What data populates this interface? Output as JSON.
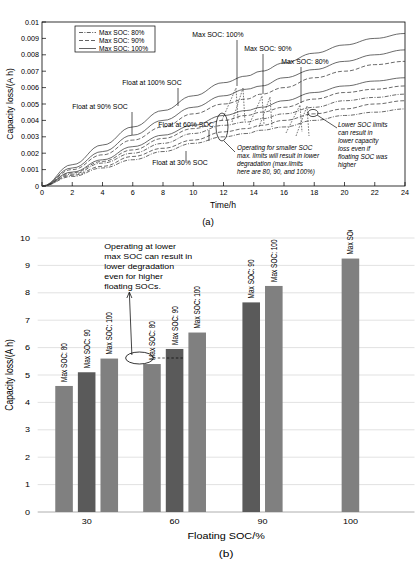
{
  "figure": {
    "panel_a_caption": "(a)",
    "panel_b_caption": "(b)"
  },
  "chart_data": [
    {
      "id": "panel_a",
      "type": "line",
      "title": "",
      "xlabel": "Time/h",
      "ylabel": "Capacity loss/(A h)",
      "xlim": [
        0,
        24
      ],
      "ylim": [
        0,
        0.01
      ],
      "xticks": [
        0,
        2,
        4,
        6,
        8,
        10,
        12,
        14,
        16,
        18,
        20,
        22,
        24
      ],
      "xticklabels": [
        "0",
        "2",
        "4",
        "6",
        "8",
        "10",
        "12",
        "14",
        "16",
        "18",
        "20",
        "22",
        "24"
      ],
      "yticks": [
        0,
        0.001,
        0.002,
        0.003,
        0.004,
        0.005,
        0.006,
        0.007,
        0.008,
        0.009,
        0.01
      ],
      "yticklabels": [
        "0",
        "0.001",
        "0.002",
        "0.003",
        "0.004",
        "0.005",
        "0.006",
        "0.007",
        "0.008",
        "0.009",
        "0.01"
      ],
      "grid": false,
      "legend_position": "upper-left",
      "legend": [
        {
          "label": "Max SOC: 80%",
          "style": "dash-dot"
        },
        {
          "label": "Max SOC: 90%",
          "style": "dashed"
        },
        {
          "label": "Max SOC: 100%",
          "style": "solid"
        }
      ],
      "series": [
        {
          "name": "Float 100% SOC / Max SOC: 100%",
          "style": "solid",
          "x": [
            0,
            2,
            4,
            6,
            8,
            10,
            12,
            13.5,
            14.5,
            16,
            18,
            20,
            22,
            24
          ],
          "y": [
            0,
            0.0013,
            0.0025,
            0.0036,
            0.0046,
            0.0055,
            0.0063,
            0.0067,
            0.007,
            0.0075,
            0.0081,
            0.0086,
            0.009,
            0.0093
          ]
        },
        {
          "name": "Float 90% SOC / Max SOC: 100%",
          "style": "solid",
          "x": [
            0,
            2,
            4,
            6,
            8,
            10,
            12,
            13.5,
            14.5,
            16,
            18,
            20,
            22,
            24
          ],
          "y": [
            0,
            0.0011,
            0.0021,
            0.0031,
            0.004,
            0.0048,
            0.0055,
            0.0059,
            0.0061,
            0.0066,
            0.0071,
            0.0076,
            0.008,
            0.0083
          ]
        },
        {
          "name": "Float 90% SOC / Max SOC: 90%",
          "style": "dashed",
          "x": [
            0,
            2,
            4,
            6,
            8,
            10,
            12,
            13.5,
            14.5,
            16,
            18,
            20,
            22,
            24
          ],
          "y": [
            0,
            0.001,
            0.0019,
            0.0028,
            0.0036,
            0.0044,
            0.005,
            0.0053,
            0.0056,
            0.006,
            0.0066,
            0.007,
            0.0074,
            0.0076
          ]
        },
        {
          "name": "Float 60% SOC / Max SOC: 100%",
          "style": "solid",
          "x": [
            0,
            2,
            4,
            6,
            8,
            10,
            12,
            13.5,
            14.5,
            16,
            18,
            20,
            22,
            24
          ],
          "y": [
            0,
            0.00085,
            0.0016,
            0.0024,
            0.0031,
            0.0037,
            0.0043,
            0.0046,
            0.0048,
            0.0052,
            0.0057,
            0.0061,
            0.0064,
            0.0066
          ]
        },
        {
          "name": "Float 60% SOC / Max SOC: 90%",
          "style": "dashed",
          "x": [
            0,
            2,
            4,
            6,
            8,
            10,
            12,
            13.5,
            14.5,
            16,
            18,
            20,
            22,
            24
          ],
          "y": [
            0,
            0.0008,
            0.0015,
            0.0022,
            0.0029,
            0.0035,
            0.004,
            0.0043,
            0.0045,
            0.0048,
            0.0053,
            0.0057,
            0.0059,
            0.0061
          ]
        },
        {
          "name": "Float 60% SOC / Max SOC: 80%",
          "style": "dash-dot",
          "x": [
            0,
            2,
            4,
            6,
            8,
            10,
            12,
            13.5,
            14.5,
            16,
            18,
            20,
            22,
            24
          ],
          "y": [
            0,
            0.00072,
            0.0014,
            0.002,
            0.0026,
            0.0032,
            0.0037,
            0.0039,
            0.0041,
            0.0044,
            0.0048,
            0.0052,
            0.0054,
            0.0056
          ]
        },
        {
          "name": "Float 30% SOC / Max SOC: 90%",
          "style": "dashed",
          "x": [
            0,
            2,
            4,
            6,
            8,
            10,
            12,
            13.5,
            14.5,
            16,
            18,
            20,
            22,
            24
          ],
          "y": [
            0,
            0.00065,
            0.0012,
            0.0018,
            0.0023,
            0.0028,
            0.0033,
            0.0035,
            0.0037,
            0.004,
            0.0044,
            0.0047,
            0.005,
            0.0052
          ]
        },
        {
          "name": "Float 30% SOC / Max SOC: 80%",
          "style": "dash-dot",
          "x": [
            0,
            2,
            4,
            6,
            8,
            10,
            12,
            13.5,
            14.5,
            16,
            18,
            20,
            22,
            24
          ],
          "y": [
            0,
            0.00058,
            0.0011,
            0.0016,
            0.0021,
            0.0026,
            0.003,
            0.0032,
            0.0034,
            0.0036,
            0.004,
            0.0043,
            0.0045,
            0.0047
          ]
        }
      ],
      "annotations": [
        {
          "text": "Max SOC: 100%",
          "target_x": 13.6,
          "target_y": 0.0069
        },
        {
          "text": "Max SOC: 90%",
          "target_x": 14.6,
          "target_y": 0.0065
        },
        {
          "text": "Max SOC: 80%",
          "target_x": 17.1,
          "target_y": 0.0061
        },
        {
          "text": "Float at 100% SOC",
          "target_x": 9.0,
          "target_y": 0.0044
        },
        {
          "text": "Float at 90% SOC",
          "target_x": 6.0,
          "target_y": 0.0031
        },
        {
          "text": "Float at 60% SOC",
          "target_x": 11.7,
          "target_y": 0.0025
        },
        {
          "text": "Float at 30% SOC",
          "target_x": 9.6,
          "target_y": 0.0014
        },
        {
          "text": "Operating for smaller SOC max. limits will result in lower degradation (max.limits here are 80, 90, and 100%)",
          "target_x": 12.9,
          "target_y": 0.0028
        },
        {
          "text": "Lower SOC limits can result in lower capacity loss even if floating SOC was higher",
          "target_x": 17.6,
          "target_y": 0.0042
        }
      ]
    },
    {
      "id": "panel_b",
      "type": "bar",
      "title": "",
      "xlabel": "Floating SOC/%",
      "ylabel": "Capacity loss/(A h)",
      "ylim": [
        0,
        10
      ],
      "yticks": [
        0,
        1,
        2,
        3,
        4,
        5,
        6,
        7,
        8,
        9,
        10
      ],
      "yticklabels": [
        "0",
        "1",
        "2",
        "3",
        "4",
        "5",
        "6",
        "7",
        "8",
        "9",
        "10"
      ],
      "categories": [
        "30",
        "60",
        "90",
        "100"
      ],
      "grid": true,
      "legend_position": "none",
      "bars": [
        {
          "group": "30",
          "label": "Max SOC: 80",
          "value": 4.6,
          "shade": "light"
        },
        {
          "group": "30",
          "label": "Max SOC: 90",
          "value": 5.1,
          "shade": "dark"
        },
        {
          "group": "30",
          "label": "Max SOC: 100",
          "value": 5.6,
          "shade": "light"
        },
        {
          "group": "60",
          "label": "Max SOC: 80",
          "value": 5.4,
          "shade": "light"
        },
        {
          "group": "60",
          "label": "Max SOC: 90",
          "value": 5.95,
          "shade": "dark"
        },
        {
          "group": "60",
          "label": "Max SOC: 100",
          "value": 6.55,
          "shade": "light"
        },
        {
          "group": "90",
          "label": "Max SOC: 90",
          "value": 7.65,
          "shade": "dark"
        },
        {
          "group": "90",
          "label": "Max SOC: 100",
          "value": 8.25,
          "shade": "light"
        },
        {
          "group": "100",
          "label": "Max SOC: 100",
          "value": 9.25,
          "shade": "light"
        }
      ],
      "annotations": [
        {
          "text": "Operating at lower max SOC can result in lower degradation even for higher floating SOCs.",
          "lines": [
            "Operating at lower",
            "max SOC can result in",
            "lower degradation",
            "even for higher",
            "floating SOCs."
          ]
        }
      ]
    }
  ],
  "colors": {
    "bar_light": "#808080",
    "bar_dark": "#5a5a5a",
    "curve": "#3a3a3a",
    "grid": "#d2d2d2",
    "axis": "#000000"
  }
}
